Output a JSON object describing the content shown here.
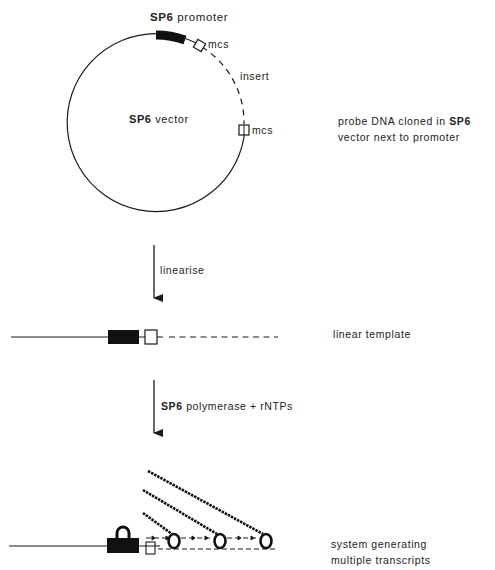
{
  "plasmid": {
    "promoter_label_bold": "SP6",
    "promoter_label_rest": " promoter",
    "mcs_top": "mcs",
    "mcs_right": "mcs",
    "insert_label": "insert",
    "vector_label_bold": "SP6",
    "vector_label_rest": " vector"
  },
  "side_notes": {
    "plasmid_line1_a": "probe DNA cloned in ",
    "plasmid_line1_b": "SP6",
    "plasmid_line2": "vector next to promoter",
    "linear": "linear template",
    "system_line1": "system generating",
    "system_line2": "multiple transcripts"
  },
  "steps": {
    "linearise": "linearise",
    "polymerase_bold": "SP6",
    "polymerase_rest": " polymerase + rNTPs"
  },
  "colors": {
    "ink": "#1a1a1a",
    "background": "#ffffff"
  }
}
